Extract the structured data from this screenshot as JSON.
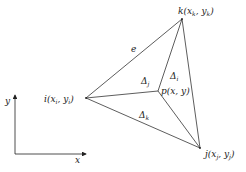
{
  "diagram": {
    "type": "triangular-element-area-coordinates",
    "nodes": {
      "k": {
        "label": "k",
        "coords": "(x",
        "sub1": "k",
        "sep": ", y",
        "sub2": "k",
        "close": ")",
        "x": 182,
        "y": 19
      },
      "i": {
        "label": "i",
        "coords": "(x",
        "sub1": "i",
        "sep": ", y",
        "sub2": "i",
        "close": ")",
        "x": 86,
        "y": 98
      },
      "j": {
        "label": "j",
        "coords": "(x",
        "sub1": "j",
        "sep": ", y",
        "sub2": "j",
        "close": ")",
        "x": 200,
        "y": 148
      },
      "p": {
        "label": "p",
        "coords": "(x, y)",
        "x": 158,
        "y": 91
      }
    },
    "edge_label": "e",
    "areas": {
      "delta_i": {
        "symbol": "Δ",
        "sub": "i"
      },
      "delta_j": {
        "symbol": "Δ",
        "sub": "j"
      },
      "delta_k": {
        "symbol": "Δ",
        "sub": "k"
      }
    },
    "axes": {
      "x_label": "x",
      "y_label": "y"
    },
    "caption": ""
  }
}
